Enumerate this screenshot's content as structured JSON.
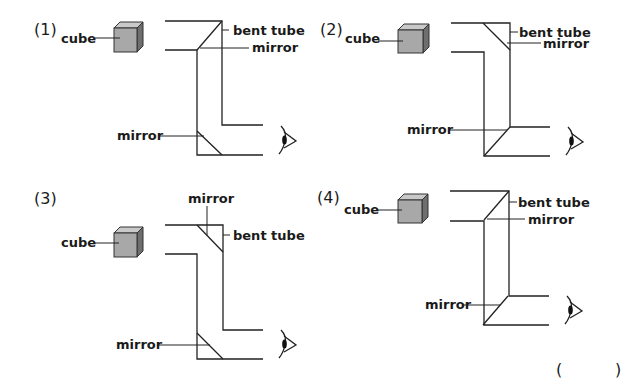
{
  "panels": [
    {
      "number": "(1)",
      "labels": {
        "cube": "cube",
        "tube": "bent tube",
        "top_mirror": "mirror",
        "bottom_mirror": "mirror"
      },
      "top_mirror_slope": "rising",
      "bottom_mirror_slope": "falling"
    },
    {
      "number": "(2)",
      "labels": {
        "cube": "cube",
        "tube": "bent tube",
        "top_mirror": "mirror",
        "bottom_mirror": "mirror"
      },
      "top_mirror_slope": "falling",
      "bottom_mirror_slope": "rising"
    },
    {
      "number": "(3)",
      "labels": {
        "cube": "cube",
        "tube": "bent tube",
        "top_mirror": "mirror",
        "bottom_mirror": "mirror"
      },
      "top_mirror_slope": "falling",
      "bottom_mirror_slope": "falling"
    },
    {
      "number": "(4)",
      "labels": {
        "cube": "cube",
        "tube": "bent tube",
        "top_mirror": "mirror",
        "bottom_mirror": "mirror"
      },
      "top_mirror_slope": "rising",
      "bottom_mirror_slope": "rising"
    }
  ],
  "answer": {
    "open": "(",
    "close": ")",
    "value": ""
  },
  "colors": {
    "cube_front": "#a8a8a8",
    "cube_side": "#6e6e6e",
    "line": "#222222"
  }
}
